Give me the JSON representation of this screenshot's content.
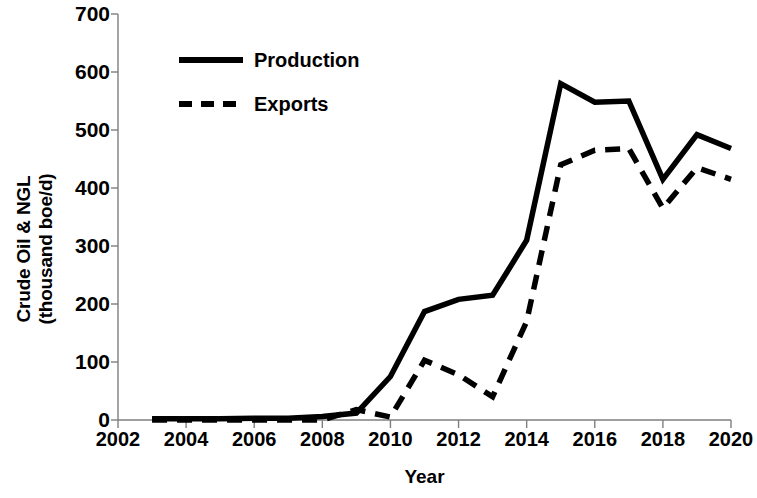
{
  "chart_data": {
    "type": "line",
    "title": "",
    "xlabel": "Year",
    "ylabel": "Crude Oil & NGL (thousand boe/d)",
    "ylabel_line1": "Crude Oil & NGL",
    "ylabel_line2": "(thousand boe/d)",
    "xlim": [
      2002,
      2020
    ],
    "ylim": [
      0,
      700
    ],
    "xticks": [
      2002,
      2004,
      2006,
      2008,
      2010,
      2012,
      2014,
      2016,
      2018,
      2020
    ],
    "yticks": [
      0,
      100,
      200,
      300,
      400,
      500,
      600,
      700
    ],
    "xtick_labels": [
      "2002",
      "2004",
      "2006",
      "2008",
      "2010",
      "2012",
      "2014",
      "2016",
      "2018",
      "2020"
    ],
    "ytick_labels": [
      "0",
      "100",
      "200",
      "300",
      "400",
      "500",
      "600",
      "700"
    ],
    "grid": false,
    "legend_position": "upper-left-inside",
    "x": [
      2003,
      2004,
      2005,
      2006,
      2007,
      2008,
      2009,
      2010,
      2011,
      2012,
      2013,
      2014,
      2015,
      2016,
      2017,
      2018,
      2019,
      2020
    ],
    "series": [
      {
        "name": "Production",
        "style": "solid",
        "color": "#000000",
        "values": [
          2,
          2,
          2,
          3,
          3,
          6,
          12,
          75,
          187,
          208,
          215,
          310,
          580,
          548,
          550,
          415,
          492,
          468
        ]
      },
      {
        "name": "Exports",
        "style": "dashed",
        "color": "#000000",
        "values": [
          0,
          0,
          0,
          0,
          0,
          0,
          18,
          5,
          103,
          78,
          40,
          170,
          440,
          465,
          468,
          365,
          435,
          415
        ]
      }
    ]
  },
  "legend": {
    "items": [
      {
        "label": "Production",
        "style": "solid"
      },
      {
        "label": "Exports",
        "style": "dashed"
      }
    ]
  }
}
